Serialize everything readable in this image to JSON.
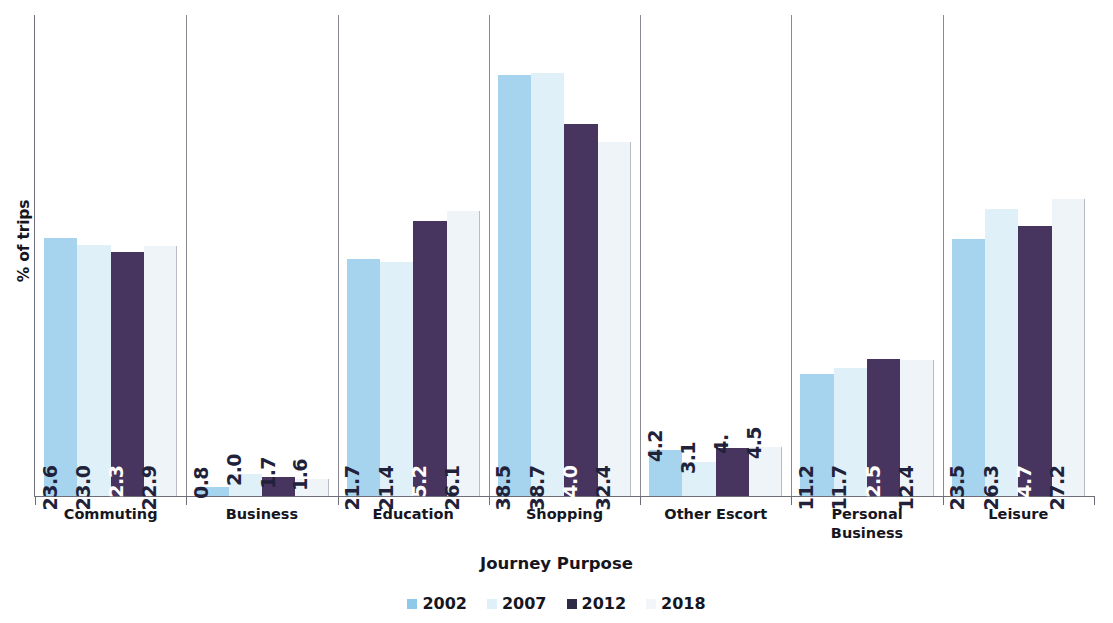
{
  "chart_data": {
    "type": "bar",
    "title": "",
    "xlabel": "Journey Purpose",
    "ylabel": "% of trips",
    "ylim": [
      0,
      44
    ],
    "grid": false,
    "legend_position": "bottom",
    "categories": [
      "Commuting",
      "Business",
      "Education",
      "Shopping",
      "Other Escort",
      "Personal\nBusiness",
      "Leisure"
    ],
    "series": [
      {
        "name": "2002",
        "color": "#a6d4ef",
        "values": [
          23.6,
          0.8,
          21.7,
          38.5,
          4.2,
          11.2,
          23.5
        ]
      },
      {
        "name": "2007",
        "color": "#dff0f9",
        "values": [
          23.0,
          2.0,
          21.4,
          38.7,
          3.1,
          11.7,
          26.3
        ]
      },
      {
        "name": "2012",
        "color": "#473560",
        "values": [
          22.3,
          1.7,
          25.2,
          34.0,
          4.4,
          12.5,
          24.7
        ]
      },
      {
        "name": "2018",
        "color": "#eff4f9",
        "values": [
          22.9,
          1.6,
          26.1,
          32.4,
          4.5,
          12.4,
          27.2
        ]
      }
    ],
    "data_labels": [
      [
        "23.6",
        "23.0",
        "22.3",
        "22.9"
      ],
      [
        "0.8",
        "2.0",
        "1.7",
        "1.6"
      ],
      [
        "21.7",
        "21.4",
        "25.2",
        "26.1"
      ],
      [
        "38.5",
        "38.7",
        "34.0",
        "32.4"
      ],
      [
        "4.2",
        "3.1",
        "4.",
        "4.5"
      ],
      [
        "11.2",
        "11.7",
        "12.5",
        "12.4"
      ],
      [
        "23.5",
        "26.3",
        "24.7",
        "27.2"
      ]
    ]
  },
  "legend": {
    "items": [
      {
        "label": "2002"
      },
      {
        "label": "2007"
      },
      {
        "label": "2012"
      },
      {
        "label": "2018"
      }
    ]
  }
}
